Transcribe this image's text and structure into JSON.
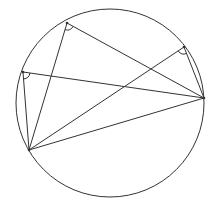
{
  "diagram": {
    "type": "inscribed-angles-in-circle",
    "stroke_color": "#333333",
    "background": "#ffffff",
    "circle": {
      "cx": 110,
      "cy": 103,
      "r": 94
    },
    "points": {
      "A": {
        "x": 67,
        "y": 23
      },
      "B": {
        "x": 23,
        "y": 72
      },
      "C": {
        "x": 29,
        "y": 150
      },
      "D": {
        "x": 204,
        "y": 98
      },
      "E": {
        "x": 184,
        "y": 47
      }
    },
    "segments": [
      [
        "A",
        "C"
      ],
      [
        "A",
        "D"
      ],
      [
        "B",
        "C"
      ],
      [
        "B",
        "D"
      ],
      [
        "E",
        "C"
      ],
      [
        "E",
        "D"
      ],
      [
        "C",
        "D"
      ]
    ],
    "angle_marks": [
      "A",
      "B",
      "E"
    ]
  }
}
